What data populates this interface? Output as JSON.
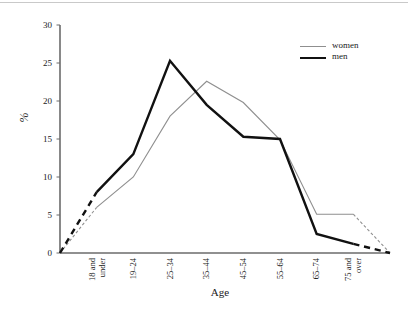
{
  "chart_data": {
    "type": "line",
    "title": "",
    "xlabel": "Age",
    "ylabel": "%",
    "categories": [
      "18 and under",
      "19–24",
      "25–34",
      "35–44",
      "45–54",
      "55–64",
      "65–74",
      "75 and over"
    ],
    "category_lines": [
      [
        "18 and",
        "under"
      ],
      [
        "19–24",
        ""
      ],
      [
        "25–34",
        ""
      ],
      [
        "35–44",
        ""
      ],
      [
        "45–54",
        ""
      ],
      [
        "55–64",
        ""
      ],
      [
        "65–74",
        ""
      ],
      [
        "75 and",
        "over"
      ]
    ],
    "series": [
      {
        "name": "women",
        "color": "#8f8f8f",
        "width": 1.1,
        "values": [
          6.0,
          10.0,
          18.0,
          22.6,
          19.8,
          14.9,
          5.1,
          5.1
        ],
        "lead_in": 0,
        "lead_out": 0
      },
      {
        "name": "men",
        "color": "#111111",
        "width": 2.4,
        "values": [
          8.0,
          13.0,
          25.3,
          19.5,
          15.3,
          15.0,
          2.5,
          1.2
        ],
        "lead_in": 0,
        "lead_out": 0
      }
    ],
    "yticks": [
      0,
      5,
      10,
      15,
      20,
      25,
      30
    ],
    "ylim": [
      0,
      30
    ],
    "xlim_pad_categories": 1,
    "grid": false,
    "legend_position": "top-right",
    "axis_color": "#6b6b6b",
    "dashed_end_segments": true
  },
  "legend": {
    "items": [
      {
        "label": "women"
      },
      {
        "label": "men"
      }
    ]
  },
  "axes": {
    "y_title": "%",
    "x_title": "Age"
  }
}
